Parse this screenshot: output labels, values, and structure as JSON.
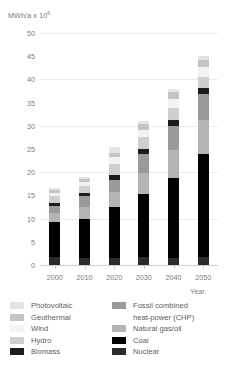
{
  "chart_data": {
    "type": "bar",
    "title": "",
    "ylabel": "MWh/a x 10",
    "ylabel_exponent": "6",
    "xlabel": "Year",
    "categories": [
      "2000",
      "2010",
      "2020",
      "2030",
      "2040",
      "2050"
    ],
    "ylim": [
      0,
      50
    ],
    "yticks": [
      "0",
      "5",
      "10",
      "15",
      "20",
      "25",
      "30",
      "35",
      "40",
      "45",
      "50"
    ],
    "grid": true,
    "stacked": true,
    "legend_position": "bottom",
    "series": [
      {
        "name": "Nuclear",
        "color": "#2b2b2b",
        "values": [
          1.8,
          1.6,
          1.6,
          1.7,
          1.6,
          1.7
        ]
      },
      {
        "name": "Coal",
        "color": "#000000",
        "values": [
          7.4,
          8.4,
          11.0,
          13.6,
          17.1,
          22.2
        ]
      },
      {
        "name": "Natural gas/oil",
        "color": "#b4b4b4",
        "values": [
          2.1,
          2.6,
          3.1,
          4.6,
          6.0,
          7.3
        ]
      },
      {
        "name": "Fossil combined heat-power (CHP)",
        "color": "#9a9a9a",
        "values": [
          1.4,
          2.2,
          2.7,
          4.0,
          5.3,
          5.6
        ]
      },
      {
        "name": "Biomass",
        "color": "#1c1c1c",
        "values": [
          0.7,
          0.8,
          0.9,
          1.0,
          1.2,
          1.3
        ]
      },
      {
        "name": "Hydro",
        "color": "#cfcfcf",
        "values": [
          1.5,
          1.4,
          2.4,
          2.6,
          2.6,
          2.4
        ]
      },
      {
        "name": "Wind",
        "color": "#f2f2f2",
        "values": [
          0.7,
          0.9,
          1.5,
          1.7,
          2.0,
          2.1
        ]
      },
      {
        "name": "Geothermal",
        "color": "#c4c4c4",
        "values": [
          0.5,
          0.6,
          1.0,
          1.2,
          1.4,
          1.6
        ]
      },
      {
        "name": "Photovoltaic",
        "color": "#e4e4e4",
        "values": [
          0.4,
          0.5,
          1.3,
          0.6,
          0.8,
          0.8
        ]
      }
    ],
    "totals": [
      16.5,
      19.0,
      25.5,
      31.0,
      38.0,
      45.0
    ]
  },
  "legend": {
    "left": [
      {
        "label": "Photovoltaic",
        "color": "#e4e4e4"
      },
      {
        "label": "Geothermal",
        "color": "#c4c4c4"
      },
      {
        "label": "Wind",
        "color": "#f4f4f4"
      },
      {
        "label": "Hydro",
        "color": "#cfcfcf"
      },
      {
        "label": "Biomass",
        "color": "#1c1c1c"
      }
    ],
    "right": [
      {
        "label": "Fossil combined",
        "color": "#9a9a9a"
      },
      {
        "label": "heat-power (CHP)",
        "color": null
      },
      {
        "label": "Natural gas/oil",
        "color": "#b4b4b4"
      },
      {
        "label": "Coal",
        "color": "#000000"
      },
      {
        "label": "Nuclear",
        "color": "#2b2b2b"
      }
    ]
  }
}
